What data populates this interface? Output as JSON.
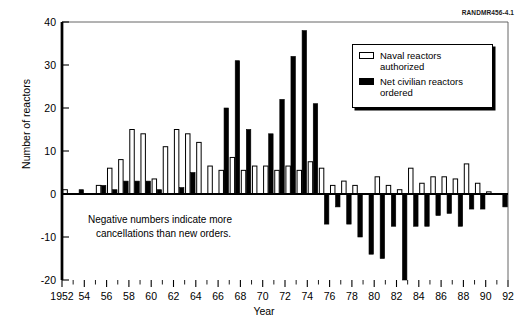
{
  "pub_id": "RANDMR456-4.1",
  "annotation": {
    "line1": "Negative numbers indicate more",
    "line2": "cancellations than new orders."
  },
  "legend": {
    "position": "top-right",
    "entries": [
      {
        "label_line1": "Naval reactors",
        "label_line2": "authorized",
        "swatch": "open",
        "color": "#ffffff"
      },
      {
        "label_line1": "Net civilian reactors",
        "label_line2": "ordered",
        "swatch": "filled",
        "color": "#000000"
      }
    ]
  },
  "chart_data": {
    "type": "bar",
    "title": "",
    "subtitle": "",
    "xlabel": "Year",
    "ylabel": "Number of reactors",
    "ylim": [
      -20,
      40
    ],
    "xlim": [
      1952,
      1992
    ],
    "ytick_labels": [
      "40",
      "30",
      "20",
      "10",
      "0",
      "-10",
      "-20"
    ],
    "ytick_values": [
      40,
      30,
      20,
      10,
      0,
      -10,
      -20
    ],
    "xtick_labels": [
      "1952",
      "54",
      "56",
      "58",
      "60",
      "62",
      "64",
      "66",
      "68",
      "70",
      "72",
      "74",
      "76",
      "78",
      "80",
      "82",
      "84",
      "86",
      "88",
      "90",
      "92"
    ],
    "xtick_values": [
      1952,
      1954,
      1956,
      1958,
      1960,
      1962,
      1964,
      1966,
      1968,
      1970,
      1972,
      1974,
      1976,
      1978,
      1980,
      1982,
      1984,
      1986,
      1988,
      1990,
      1992
    ],
    "minor_ticks_every": 1,
    "grid": false,
    "legend_position": "top-right",
    "annotations": [
      "Negative numbers indicate more cancellations than new orders."
    ],
    "categories": [
      1952,
      1953,
      1954,
      1955,
      1956,
      1957,
      1958,
      1959,
      1960,
      1961,
      1962,
      1963,
      1964,
      1965,
      1966,
      1967,
      1968,
      1969,
      1970,
      1971,
      1972,
      1973,
      1974,
      1975,
      1976,
      1977,
      1978,
      1979,
      1980,
      1981,
      1982,
      1983,
      1984,
      1985,
      1986,
      1987,
      1988,
      1989,
      1990,
      1991
    ],
    "series": [
      {
        "name": "Naval reactors authorized",
        "color": "#ffffff",
        "edge": "#000000",
        "values": [
          1,
          0,
          0,
          2,
          6,
          8,
          15,
          14,
          3.5,
          11,
          15,
          14,
          12,
          6.5,
          5.5,
          8.5,
          5.5,
          6.5,
          6.5,
          5.5,
          6.5,
          5.5,
          7.5,
          6,
          2,
          3,
          2,
          0,
          4,
          2,
          1,
          6,
          2.5,
          4,
          4,
          3.5,
          7,
          2.5,
          0.5,
          0
        ]
      },
      {
        "name": "Net civilian reactors ordered",
        "color": "#000000",
        "edge": "#000000",
        "values": [
          0,
          1,
          0,
          2,
          1,
          3,
          3,
          3,
          1,
          0,
          1.5,
          5,
          0,
          0,
          20,
          31,
          15,
          0,
          14,
          22,
          32,
          38,
          21,
          -7,
          -3,
          -7,
          -10,
          -14,
          -15,
          -7.5,
          -20,
          -7.5,
          -7.5,
          -5,
          -4.5,
          -7.5,
          -3.5,
          -3.5,
          0,
          -3
        ]
      }
    ]
  }
}
